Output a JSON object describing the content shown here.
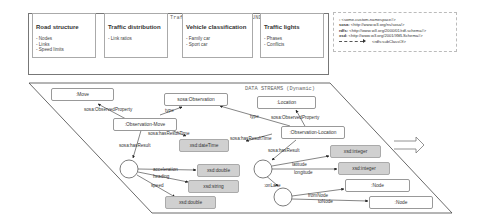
{
  "background_knowledge": {
    "title": "Traffic network - BACKGROUND KNOWLEDGE (Static)",
    "boxes": [
      {
        "title": "Road structure",
        "items": [
          "- Nodes",
          "- Links",
          "- Speed limits"
        ]
      },
      {
        "title": "Traffic distribution",
        "items": [
          "- Link ratios"
        ]
      },
      {
        "title": "Vehicle classification",
        "items": [
          "- Family car",
          "- Sport car"
        ]
      },
      {
        "title": "Traffic lights",
        "items": [
          "- Phases",
          "- Conflicts"
        ]
      }
    ]
  },
  "namespaces": {
    "lines": [
      {
        "prefix": ":",
        "value": "<some-custom-namespace#>"
      },
      {
        "prefix": "sosa:",
        "value": "<http://www.w3.org/ns/sosa/>"
      },
      {
        "prefix": "rdfs:",
        "value": "<http://www.w3.org/2000/01/rdf-schema#>"
      },
      {
        "prefix": "xsd:",
        "value": "<http://www.w3.org/2001/XMLSchema#>"
      }
    ],
    "legend_label": "<rdfs:subClassOf>"
  },
  "data_streams": {
    "title": "DATA STREAMS (Dynamic)",
    "nodes": {
      "move": ":Move",
      "observation": "sosa:Observation",
      "location": ":Location",
      "obs_move": ":Observation-Move",
      "obs_location": ":Observation-Location",
      "datetime": "xsd:dateTime",
      "double1": "xsd:double",
      "string": "xsd:string",
      "double2": "xsd:double",
      "integer1": "xsd:integer",
      "integer2": "xsd:integer",
      "node1": ":Node",
      "node2": ":Node"
    },
    "edges": {
      "observed_property_move": "sosa:ObservedProperty",
      "type_move": "type",
      "type_location": "type",
      "observed_property_location": "sosa:ObservedProperty",
      "has_result_time_move": "sosa:hasResultTime",
      "has_result_time_location": "sosa:hasResultTime",
      "has_result_move": "sosa:hasResult",
      "has_result_location": "sosa:hasResult",
      "acceleration": "acceleration",
      "heading": "heading",
      "speed": "speed",
      "latitude": "latitude",
      "longitude": "longitude",
      "on_lane": ":onLane",
      "from_node": "fromNode",
      "to_node": "toNode"
    }
  }
}
